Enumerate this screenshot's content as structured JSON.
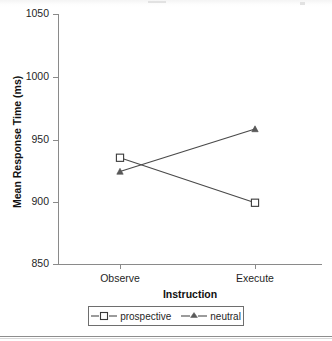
{
  "chart_data": {
    "type": "line",
    "title": "",
    "xlabel": "Instruction",
    "ylabel": "Mean Response Time (ms)",
    "categories": [
      "Observe",
      "Execute"
    ],
    "ylim": [
      850,
      1050
    ],
    "yticks": [
      850,
      900,
      950,
      1000,
      1050
    ],
    "ytick_labels": [
      "850",
      "900",
      "950",
      "1000",
      "1050"
    ],
    "grid": false,
    "legend_position": "bottom",
    "series": [
      {
        "name": "prospective",
        "marker": "open-square",
        "values": [
          935,
          899
        ]
      },
      {
        "name": "neutral",
        "marker": "filled-triangle",
        "values": [
          924,
          958
        ]
      }
    ]
  },
  "axes": {
    "y_title": "Mean Response Time (ms)",
    "x_title": "Instruction",
    "y_tick_labels": [
      "1050",
      "1000",
      "950",
      "900",
      "850"
    ],
    "x_tick_labels": [
      "Observe",
      "Execute"
    ]
  },
  "legend": {
    "entries": [
      {
        "label": "prospective",
        "marker": "open-square-icon"
      },
      {
        "label": "neutral",
        "marker": "filled-triangle-icon"
      }
    ]
  },
  "colors": {
    "line": "#4a4a4a",
    "axis": "#8a8a8a",
    "text": "#1f1f1f",
    "legend_border": "#6e6e6e",
    "background": "#ffffff"
  }
}
